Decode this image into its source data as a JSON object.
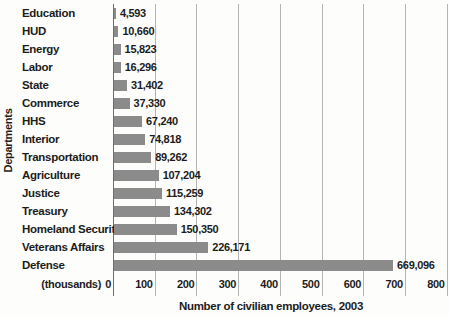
{
  "chart_data": {
    "type": "bar",
    "orientation": "horizontal",
    "xlabel": "Number of civilian employees, 2003",
    "ylabel": "Departments",
    "x_unit_label": "(thousands)",
    "categories": [
      "Education",
      "HUD",
      "Energy",
      "Labor",
      "State",
      "Commerce",
      "HHS",
      "Interior",
      "Transportation",
      "Agriculture",
      "Justice",
      "Treasury",
      "Homeland Security",
      "Veterans Affairs",
      "Defense"
    ],
    "values": [
      4593,
      10660,
      15823,
      16296,
      31402,
      37330,
      67240,
      74818,
      89262,
      107204,
      115259,
      134302,
      150350,
      226171,
      669096
    ],
    "value_labels": [
      "4,593",
      "10,660",
      "15,823",
      "16,296",
      "31,402",
      "37,330",
      "67,240",
      "74,818",
      "89,262",
      "107,204",
      "115,259",
      "134,302",
      "150,350",
      "226,171",
      "669,096"
    ],
    "x_ticks": [
      0,
      100,
      200,
      300,
      400,
      500,
      600,
      700,
      800
    ],
    "x_tick_labels": [
      "0",
      "100",
      "200",
      "300",
      "400",
      "500",
      "600",
      "700",
      "800"
    ],
    "xlim": [
      0,
      800
    ],
    "grid": true,
    "legend": "none",
    "colors": {
      "bar": "#8b8b8b",
      "gridline": "#b4b4b4",
      "axis_line": "#6e6e6e",
      "text": "#1c1c1c",
      "background": "#fdfdfb"
    }
  }
}
